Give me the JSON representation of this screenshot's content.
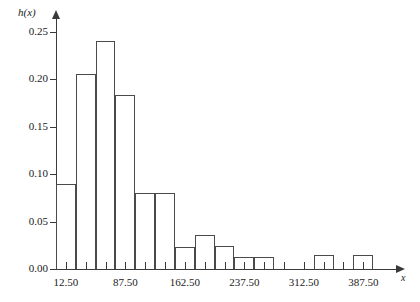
{
  "chart_data": {
    "type": "bar",
    "title": "",
    "subtitle": "",
    "xlabel": "x",
    "ylabel": "h(x)",
    "grid": false,
    "legend": null,
    "xlim": [
      0,
      425
    ],
    "ylim": [
      0,
      0.26
    ],
    "bin_width": 25,
    "y_ticks": [
      {
        "value": 0.0,
        "label": "0.00"
      },
      {
        "value": 0.05,
        "label": "0.05"
      },
      {
        "value": 0.1,
        "label": "0.10"
      },
      {
        "value": 0.15,
        "label": "0.15"
      },
      {
        "value": 0.2,
        "label": "0.20"
      },
      {
        "value": 0.25,
        "label": "0.25"
      }
    ],
    "x_ticks": [
      {
        "value": 12.5,
        "label": "12.50"
      },
      {
        "value": 37.5,
        "label": ""
      },
      {
        "value": 62.5,
        "label": ""
      },
      {
        "value": 87.5,
        "label": "87.50"
      },
      {
        "value": 112.5,
        "label": ""
      },
      {
        "value": 137.5,
        "label": ""
      },
      {
        "value": 162.5,
        "label": "162.50"
      },
      {
        "value": 187.5,
        "label": ""
      },
      {
        "value": 212.5,
        "label": ""
      },
      {
        "value": 237.5,
        "label": "237.50"
      },
      {
        "value": 262.5,
        "label": ""
      },
      {
        "value": 287.5,
        "label": ""
      },
      {
        "value": 312.5,
        "label": "312.50"
      },
      {
        "value": 337.5,
        "label": ""
      },
      {
        "value": 362.5,
        "label": ""
      },
      {
        "value": 387.5,
        "label": "387.50"
      }
    ],
    "categories": [
      "0-25",
      "25-50",
      "50-75",
      "75-100",
      "100-125",
      "125-150",
      "150-175",
      "175-200",
      "200-225",
      "225-250",
      "250-275",
      "275-300",
      "300-325",
      "325-350",
      "350-375",
      "375-400"
    ],
    "bins": [
      {
        "start": 0,
        "end": 25,
        "center": 12.5,
        "value": 0.09
      },
      {
        "start": 25,
        "end": 50,
        "center": 37.5,
        "value": 0.205
      },
      {
        "start": 50,
        "end": 75,
        "center": 62.5,
        "value": 0.24
      },
      {
        "start": 75,
        "end": 100,
        "center": 87.5,
        "value": 0.183
      },
      {
        "start": 100,
        "end": 125,
        "center": 112.5,
        "value": 0.08
      },
      {
        "start": 125,
        "end": 150,
        "center": 137.5,
        "value": 0.08
      },
      {
        "start": 150,
        "end": 175,
        "center": 162.5,
        "value": 0.023
      },
      {
        "start": 175,
        "end": 200,
        "center": 187.5,
        "value": 0.036
      },
      {
        "start": 200,
        "end": 225,
        "center": 212.5,
        "value": 0.024
      },
      {
        "start": 225,
        "end": 250,
        "center": 237.5,
        "value": 0.013
      },
      {
        "start": 250,
        "end": 275,
        "center": 262.5,
        "value": 0.013
      },
      {
        "start": 275,
        "end": 300,
        "center": 287.5,
        "value": 0.0
      },
      {
        "start": 300,
        "end": 325,
        "center": 312.5,
        "value": 0.0
      },
      {
        "start": 325,
        "end": 350,
        "center": 337.5,
        "value": 0.015
      },
      {
        "start": 350,
        "end": 375,
        "center": 362.5,
        "value": 0.0
      },
      {
        "start": 375,
        "end": 400,
        "center": 387.5,
        "value": 0.015
      }
    ],
    "values": [
      0.09,
      0.205,
      0.24,
      0.183,
      0.08,
      0.08,
      0.023,
      0.036,
      0.024,
      0.013,
      0.013,
      0.0,
      0.0,
      0.015,
      0.0,
      0.015
    ]
  },
  "style": {
    "bar_stroke": "#4a4a4a",
    "bar_fill": "transparent",
    "axis_color": "#3a3a3a",
    "background": "#ffffff",
    "text_color": "#1a1a1a"
  }
}
